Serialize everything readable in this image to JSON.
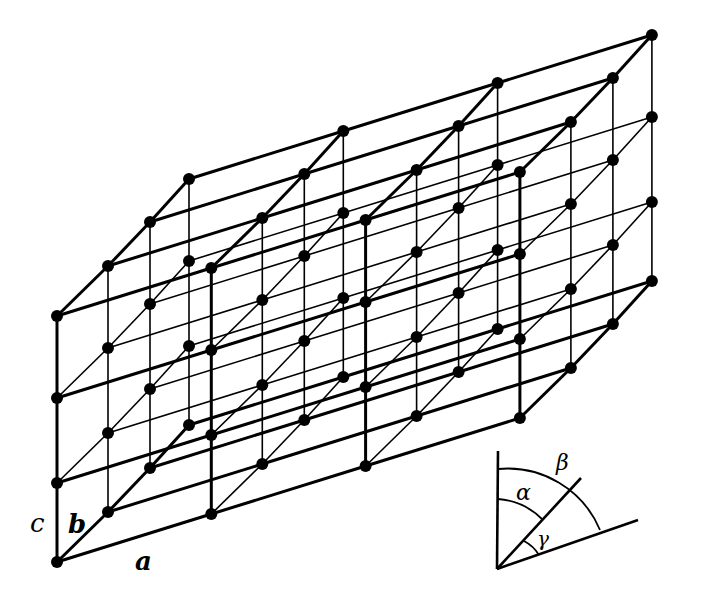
{
  "diagram": {
    "lattice": {
      "origin": [
        57,
        562
      ],
      "a_step": [
        154.3,
        -48
      ],
      "a_count": 3,
      "b_offsets": [
        [
          0,
          0
        ],
        [
          51,
          -50
        ],
        [
          93,
          -94
        ],
        [
          132,
          -137
        ]
      ],
      "c_offsets": [
        0,
        -79,
        -164,
        -246
      ],
      "node_radius": 6,
      "color": "#000000"
    },
    "axis_labels": {
      "a": "a",
      "b": "b",
      "c": "c"
    },
    "angle_inset": {
      "origin": [
        497,
        569
      ],
      "vertical_end": [
        498,
        451
      ],
      "horizontal_end": [
        638,
        520
      ],
      "diagonal_end": [
        581,
        478
      ],
      "labels": {
        "alpha": "α",
        "beta": "β",
        "gamma": "γ"
      }
    }
  }
}
